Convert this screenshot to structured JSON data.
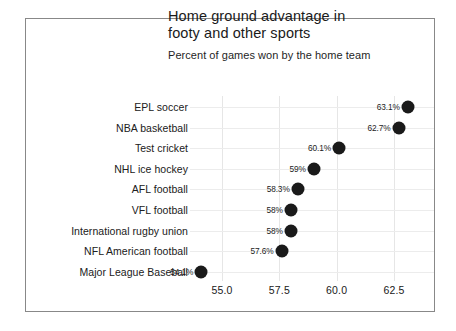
{
  "figure": {
    "title_line1": "Home ground advantage in",
    "title_line2": "footy and other sports",
    "subtitle": "Percent of games won by the home team"
  },
  "chart_data": {
    "type": "scatter",
    "title": "Home ground advantage in footy and other sports",
    "subtitle": "Percent of games won by the home team",
    "xlabel": "",
    "ylabel": "",
    "xlim": [
      53.6,
      64.2
    ],
    "grid": true,
    "legend": null,
    "orientation": "horizontal-dot-plot",
    "marker_color": "#1a1a1a",
    "categories": [
      "EPL soccer",
      "NBA basketball",
      "Test cricket",
      "NHL ice hockey",
      "AFL football",
      "VFL football",
      "International rugby union",
      "NFL American football",
      "Major League Baseball"
    ],
    "values": [
      63.1,
      62.7,
      60.1,
      59.0,
      58.3,
      58.0,
      58.0,
      57.6,
      54.1
    ],
    "data_labels": [
      "63.1%",
      "62.7%",
      "60.1%",
      "59%",
      "58.3%",
      "58%",
      "58%",
      "57.6%",
      "54.1%"
    ],
    "xticks": [
      55.0,
      57.5,
      60.0,
      62.5
    ],
    "xtick_labels": [
      "55.0",
      "57.5",
      "60.0",
      "62.5"
    ]
  }
}
